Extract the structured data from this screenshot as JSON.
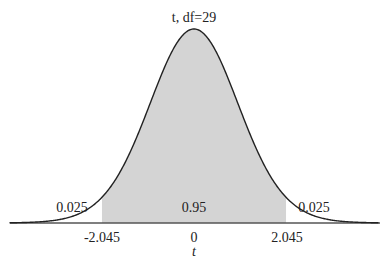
{
  "chart_data": {
    "type": "area",
    "distribution": "t",
    "df": 29,
    "title": "t, df=29",
    "xlabel": "t",
    "ylabel": "",
    "x_ticks": [
      {
        "value": -2.045,
        "label": "-2.045"
      },
      {
        "value": 0,
        "label": "0"
      },
      {
        "value": 2.045,
        "label": "2.045"
      }
    ],
    "regions": [
      {
        "name": "left-tail",
        "from": null,
        "to": -2.045,
        "area": 0.025,
        "label": "0.025",
        "shaded": false
      },
      {
        "name": "center",
        "from": -2.045,
        "to": 2.045,
        "area": 0.95,
        "label": "0.95",
        "shaded": true
      },
      {
        "name": "right-tail",
        "from": 2.045,
        "to": null,
        "area": 0.025,
        "label": "0.025",
        "shaded": false
      }
    ],
    "critical_values": [
      -2.045,
      2.045
    ],
    "xlim": [
      -4.1,
      4.1
    ],
    "grid": false,
    "legend": false
  },
  "colors": {
    "shade": "#d4d4d4",
    "curve": "#222222",
    "axis": "#555555"
  }
}
